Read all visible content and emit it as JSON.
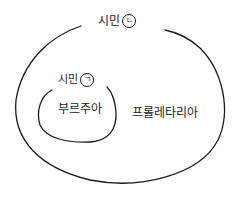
{
  "diagram": {
    "type": "nested-set-diagram",
    "style": "hand-drawn",
    "stroke_color": "#1a1a1a",
    "background": "#ffffff",
    "outer_set": {
      "label": "시민",
      "marker": "ㄴ",
      "contains": [
        "inner_set",
        "proletariat"
      ]
    },
    "inner_set": {
      "label": "시민",
      "marker": "ㄱ",
      "contains": [
        "bourgeoisie"
      ]
    },
    "regions": {
      "bourgeoisie": "부르주아",
      "proletariat": "프롤레타리아"
    }
  }
}
